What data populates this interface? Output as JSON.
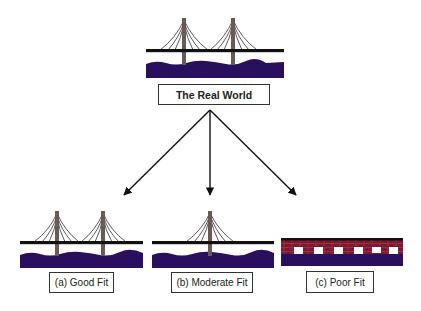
{
  "title": "The Real World",
  "colors": {
    "water": "#2a0f5e",
    "deck": "#111111",
    "tower": "#6a5a55",
    "cable": "#3a3030",
    "brick": "#7a1a2e",
    "arrow": "#111111",
    "border": "#333333"
  },
  "top": {
    "label": "The Real World",
    "description": "Suspension bridge with two towers"
  },
  "models": [
    {
      "id": "a",
      "label": "(a) Good Fit",
      "description": "Bridge with two towers, closely matching the real world"
    },
    {
      "id": "b",
      "label": "(b) Moderate Fit",
      "description": "Bridge with one tower"
    },
    {
      "id": "c",
      "label": "(c) Poor Fit",
      "description": "Brick-like deck with windows over water, no towers"
    }
  ]
}
